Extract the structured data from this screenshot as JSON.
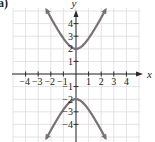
{
  "panel_label": "a)",
  "chart_data": {
    "type": "line",
    "title": "",
    "xlabel": "x",
    "ylabel": "y",
    "xlim": [
      -5,
      5
    ],
    "ylim": [
      -5.3,
      5.3
    ],
    "grid": true,
    "x_ticks": [
      -4,
      -3,
      -2,
      -1,
      1,
      2,
      3,
      4
    ],
    "x_tick_labels": [
      "−4",
      "−3",
      "−2",
      "−1",
      "1",
      "2",
      "3",
      "4"
    ],
    "y_ticks": [
      4,
      3,
      2,
      1,
      -1,
      -2,
      -3,
      -4
    ],
    "y_tick_labels": [
      "4",
      "3",
      "2",
      "1",
      "−1",
      "−2",
      "−3",
      "−4"
    ],
    "series": [
      {
        "name": "upper branch",
        "equation": "y = 2√(1 + x²)",
        "vertex": [
          0,
          2
        ],
        "x": [
          -2.3,
          -2,
          -1.5,
          -1,
          -0.5,
          0,
          0.5,
          1,
          1.5,
          2,
          2.3
        ],
        "y": [
          5.01,
          4.47,
          3.61,
          2.83,
          2.24,
          2,
          2.24,
          2.83,
          3.61,
          4.47,
          5.01
        ]
      },
      {
        "name": "lower branch",
        "equation": "y = −2√(1 + x²)",
        "vertex": [
          0,
          -2
        ],
        "x": [
          -2.3,
          -2,
          -1.5,
          -1,
          -0.5,
          0,
          0.5,
          1,
          1.5,
          2,
          2.3
        ],
        "y": [
          -5.01,
          -4.47,
          -3.61,
          -2.83,
          -2.24,
          -2,
          -2.24,
          -2.83,
          -3.61,
          -4.47,
          -5.01
        ]
      }
    ],
    "curve_color": "#7b7078",
    "axis_color": "#2a2a2a",
    "grid_color": "#dcdcdc",
    "arrows": "both ends of each branch"
  }
}
